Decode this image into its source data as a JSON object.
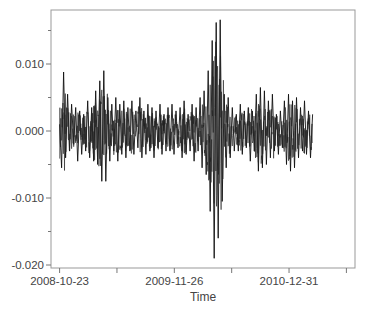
{
  "chart_data": {
    "type": "line",
    "title": "",
    "xlabel": "Time",
    "ylabel": "",
    "ylim": [
      -0.0205,
      0.0178
    ],
    "grid": false,
    "legend": null,
    "y_ticks": [
      0.01,
      0.0,
      -0.01,
      -0.02
    ],
    "y_tick_labels": [
      "0.010",
      "0.000",
      "-0.010",
      "-0.020"
    ],
    "y_minor_ticks": [
      0.015,
      0.005,
      -0.005,
      -0.015
    ],
    "x_tick_labels": [
      "2008-10-23",
      "",
      "2009-11-26",
      "",
      "2010-12-31",
      ""
    ],
    "x_tick_positions": [
      0,
      200,
      400,
      600,
      800,
      1000
    ],
    "x_range": [
      -30,
      1030
    ],
    "series": [
      {
        "name": "returns",
        "color": "#111111",
        "x_index_step": 7,
        "values": [
          0.001,
          -0.0055,
          0.0088,
          -0.004,
          0.0055,
          -0.003,
          0.004,
          -0.002,
          0.0035,
          -0.0045,
          0.003,
          -0.0035,
          0.0025,
          -0.003,
          0.0045,
          -0.004,
          0.0035,
          -0.0045,
          0.006,
          -0.005,
          0.0075,
          -0.0075,
          0.009,
          -0.0075,
          0.005,
          -0.0045,
          0.004,
          -0.003,
          0.005,
          -0.0045,
          0.004,
          -0.0035,
          0.0045,
          -0.004,
          0.0035,
          -0.003,
          0.0045,
          -0.0035,
          0.003,
          -0.0025,
          0.005,
          -0.004,
          0.003,
          -0.0035,
          0.004,
          -0.003,
          0.0035,
          -0.004,
          0.003,
          -0.0025,
          0.004,
          -0.0035,
          0.0025,
          -0.003,
          0.0035,
          -0.003,
          0.004,
          -0.0035,
          0.003,
          -0.0025,
          0.0035,
          -0.004,
          0.0045,
          -0.0035,
          0.0025,
          -0.003,
          0.004,
          -0.0045,
          0.0035,
          -0.003,
          0.005,
          -0.0055,
          0.006,
          -0.0065,
          0.009,
          -0.012,
          0.0135,
          -0.019,
          0.0162,
          -0.016,
          0.0166,
          -0.0105,
          0.0055,
          -0.0055,
          0.005,
          -0.004,
          0.0035,
          -0.003,
          0.0025,
          -0.003,
          0.004,
          -0.0035,
          0.003,
          -0.0025,
          0.0035,
          -0.0045,
          0.003,
          -0.003,
          0.0055,
          -0.006,
          0.0065,
          -0.0055,
          0.006,
          -0.005,
          0.0045,
          -0.004,
          0.0055,
          -0.003,
          0.0025,
          -0.0035,
          0.003,
          -0.0025,
          0.0045,
          -0.005,
          0.0055,
          -0.006,
          0.0045,
          -0.0055,
          0.005,
          -0.004,
          0.0035,
          -0.003,
          0.0045,
          -0.0035,
          0.003,
          -0.004,
          0.0025
        ]
      }
    ]
  },
  "axes": {
    "x_title": "Time",
    "y_labels": [
      "0.010",
      "0.000",
      "-0.010",
      "-0.020"
    ],
    "x_labels": [
      "2008-10-23",
      "2009-11-26",
      "2010-12-31"
    ]
  }
}
